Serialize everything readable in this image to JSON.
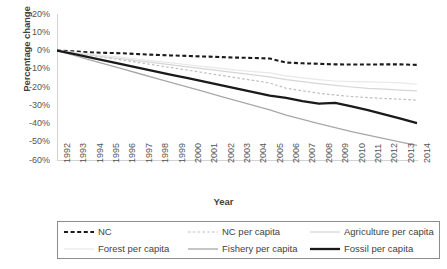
{
  "chart_data": {
    "type": "line",
    "title": "",
    "xlabel": "Year",
    "ylabel": "Percentage change",
    "grid": false,
    "legend_position": "bottom",
    "ylim": [
      -60,
      20
    ],
    "yticks": [
      "20%",
      "10%",
      "0%",
      "-10%",
      "-20%",
      "-30%",
      "-40%",
      "-50%",
      "-60%"
    ],
    "ytick_values": [
      20,
      10,
      0,
      -10,
      -20,
      -30,
      -40,
      -50,
      -60
    ],
    "categories": [
      "1992",
      "1993",
      "1994",
      "1995",
      "1996",
      "1997",
      "1998",
      "1999",
      "2000",
      "2001",
      "2002",
      "2003",
      "2004",
      "2005",
      "2006",
      "2007",
      "2008",
      "2009",
      "2010",
      "2011",
      "2012",
      "2013",
      "2014"
    ],
    "series": [
      {
        "name": "NC",
        "color": "#1a1a1a",
        "style": "dashed",
        "width": 2.1,
        "values": [
          0,
          -0.5,
          -1.0,
          -1.3,
          -1.5,
          -2.0,
          -2.4,
          -2.7,
          -3.0,
          -3.3,
          -3.6,
          -3.9,
          -4.1,
          -4.4,
          -6.6,
          -7.0,
          -7.3,
          -7.6,
          -7.7,
          -7.7,
          -7.6,
          -7.6,
          -7.9
        ]
      },
      {
        "name": "NC per capita",
        "color": "#bdbdbd",
        "style": "dashed",
        "width": 1.2,
        "values": [
          0,
          -1.3,
          -2.6,
          -3.9,
          -5.2,
          -6.6,
          -8.0,
          -9.4,
          -10.8,
          -12.2,
          -13.6,
          -15.0,
          -16.4,
          -17.8,
          -20.7,
          -22.1,
          -23.4,
          -24.4,
          -25.2,
          -25.8,
          -26.3,
          -26.7,
          -27.2
        ]
      },
      {
        "name": "Agriculture per capita",
        "color": "#d6d6d6",
        "style": "solid",
        "width": 1.2,
        "values": [
          0,
          -1.2,
          -2.4,
          -3.6,
          -4.6,
          -5.7,
          -6.8,
          -7.9,
          -9.0,
          -10.1,
          -11.2,
          -12.3,
          -13.4,
          -14.5,
          -16.0,
          -17.1,
          -18.1,
          -19.1,
          -20.0,
          -20.7,
          -21.2,
          -21.7,
          -22.1
        ]
      },
      {
        "name": "Forest per capita",
        "color": "#e8e8e8",
        "style": "solid",
        "width": 1.2,
        "values": [
          0,
          -0.9,
          -1.9,
          -2.9,
          -3.8,
          -4.8,
          -5.8,
          -6.8,
          -7.8,
          -8.8,
          -9.8,
          -10.8,
          -11.6,
          -12.3,
          -13.9,
          -15.0,
          -16.0,
          -16.7,
          -17.0,
          -17.2,
          -17.4,
          -17.7,
          -18.5
        ]
      },
      {
        "name": "Fishery per capita",
        "color": "#a8a8a8",
        "style": "solid",
        "width": 1.3,
        "values": [
          0,
          -2.6,
          -5.1,
          -7.6,
          -10.1,
          -12.6,
          -15.1,
          -17.6,
          -20.1,
          -22.6,
          -25.1,
          -27.6,
          -30.1,
          -32.6,
          -35.4,
          -37.8,
          -40.1,
          -42.3,
          -44.4,
          -46.4,
          -48.3,
          -50.2,
          -52.0
        ]
      },
      {
        "name": "Fossil per capita",
        "color": "#1a1a1a",
        "style": "solid",
        "width": 2.3,
        "values": [
          0,
          -1.9,
          -3.8,
          -5.7,
          -7.6,
          -9.5,
          -11.4,
          -13.3,
          -15.2,
          -17.1,
          -19.0,
          -20.9,
          -22.8,
          -24.7,
          -26.0,
          -27.8,
          -29.1,
          -28.7,
          -30.6,
          -32.7,
          -35.0,
          -37.3,
          -39.8
        ]
      }
    ]
  },
  "legend": {
    "row1": [
      {
        "label": "NC",
        "series": "NC"
      },
      {
        "label": "NC per capita",
        "series": "NC per capita"
      },
      {
        "label": "Agriculture per capita",
        "series": "Agriculture per capita"
      }
    ],
    "row2": [
      {
        "label": "Forest per capita",
        "series": "Forest per capita"
      },
      {
        "label": "Fishery per capita",
        "series": "Fishery per capita"
      },
      {
        "label": "Fossil per capita",
        "series": "Fossil per capita"
      }
    ]
  }
}
